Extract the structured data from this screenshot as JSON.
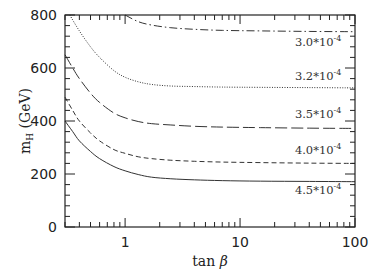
{
  "chart_data": {
    "type": "line",
    "title": "",
    "xlabel": "tan β",
    "ylabel": "m_H (GeV)",
    "xscale": "log",
    "xlim": [
      0.3,
      100
    ],
    "ylim": [
      0,
      800
    ],
    "x_ticks": [
      {
        "value": 1,
        "label": "1"
      },
      {
        "value": 10,
        "label": "10"
      },
      {
        "value": 100,
        "label": "100"
      }
    ],
    "y_ticks": [
      {
        "value": 0,
        "label": "0"
      },
      {
        "value": 200,
        "label": "200"
      },
      {
        "value": 400,
        "label": "400"
      },
      {
        "value": 600,
        "label": "600"
      },
      {
        "value": 800,
        "label": "800"
      }
    ],
    "grid": false,
    "legend": "inline labels at right",
    "series": [
      {
        "name": "3.0*10^-4",
        "label_main": "3.0*10",
        "label_exp": "-4",
        "style": "dash-dot",
        "x": [
          1.0,
          1.3,
          1.7,
          2.5,
          4,
          7,
          15,
          40,
          100
        ],
        "y": [
          800,
          775,
          762,
          752,
          746,
          742,
          740,
          738,
          737
        ]
      },
      {
        "name": "3.2*10^-4",
        "label_main": "3.2*10",
        "label_exp": "-4",
        "style": "dotted",
        "x": [
          0.33,
          0.4,
          0.5,
          0.6,
          0.8,
          1.0,
          1.3,
          1.7,
          2.5,
          4,
          7,
          15,
          40,
          100
        ],
        "y": [
          800,
          740,
          680,
          640,
          590,
          565,
          548,
          538,
          532,
          530,
          528,
          527,
          526,
          525
        ]
      },
      {
        "name": "3.5*10^-4",
        "label_main": "3.5*10",
        "label_exp": "-4",
        "style": "long-dash",
        "x": [
          0.3,
          0.35,
          0.4,
          0.5,
          0.6,
          0.8,
          1.0,
          1.3,
          1.7,
          2.5,
          4,
          7,
          15,
          40,
          100
        ],
        "y": [
          650,
          600,
          560,
          505,
          470,
          430,
          412,
          398,
          390,
          385,
          380,
          377,
          375,
          373,
          372
        ]
      },
      {
        "name": "4.0*10^-4",
        "label_main": "4.0*10",
        "label_exp": "-4",
        "style": "short-dash",
        "x": [
          0.3,
          0.35,
          0.4,
          0.5,
          0.6,
          0.8,
          1.0,
          1.3,
          1.7,
          2.5,
          4,
          7,
          15,
          40,
          100
        ],
        "y": [
          490,
          440,
          400,
          355,
          325,
          292,
          278,
          265,
          258,
          252,
          248,
          245,
          243,
          241,
          240
        ]
      },
      {
        "name": "4.5*10^-4",
        "label_main": "4.5*10",
        "label_exp": "-4",
        "style": "solid",
        "x": [
          0.3,
          0.35,
          0.4,
          0.5,
          0.6,
          0.8,
          1.0,
          1.3,
          1.7,
          2.5,
          4,
          7,
          15,
          40,
          100
        ],
        "y": [
          400,
          360,
          325,
          285,
          258,
          228,
          212,
          198,
          188,
          182,
          178,
          175,
          173,
          172,
          171
        ]
      }
    ],
    "annotations": [
      {
        "text": "3.0*10^-4",
        "x": 30,
        "y": 700
      },
      {
        "text": "3.2*10^-4",
        "x": 30,
        "y": 570
      },
      {
        "text": "3.5*10^-4",
        "x": 30,
        "y": 425
      },
      {
        "text": "4.0*10^-4",
        "x": 30,
        "y": 290
      },
      {
        "text": "4.5*10^-4",
        "x": 30,
        "y": 140
      }
    ]
  },
  "axes": {
    "xlabel_main": "tan ",
    "xlabel_greek": "β",
    "ylabel_main": "m",
    "ylabel_sub": "H",
    "ylabel_unit": " (GeV)"
  }
}
